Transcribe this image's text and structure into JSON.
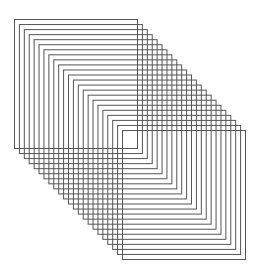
{
  "figure": {
    "background": "#ffffff",
    "stroke_color": "#555555",
    "stroke_width": 1,
    "count": 23,
    "first": {
      "x": 14,
      "y": 19,
      "width": 123,
      "height": 129
    },
    "last": {
      "x": 122,
      "y": 130,
      "width": 123,
      "height": 129
    }
  }
}
